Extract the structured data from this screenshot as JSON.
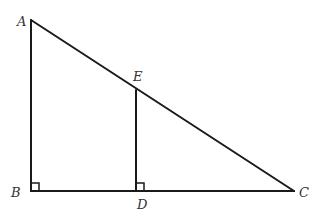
{
  "diagram": {
    "type": "geometry",
    "points": {
      "A": {
        "label": "A",
        "x": 31,
        "y": 20
      },
      "B": {
        "label": "B",
        "x": 31,
        "y": 191
      },
      "C": {
        "label": "C",
        "x": 294,
        "y": 191
      },
      "D": {
        "label": "D",
        "x": 136,
        "y": 191
      },
      "E": {
        "label": "E",
        "x": 136,
        "y": 90
      }
    },
    "segments": [
      "AB",
      "BC",
      "AC",
      "ED"
    ],
    "right_angles": [
      "B",
      "D"
    ],
    "colors": {
      "stroke": "#1a1a1a",
      "label": "#333333",
      "background": "#ffffff"
    }
  }
}
